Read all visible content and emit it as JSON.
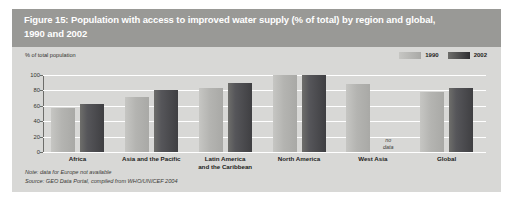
{
  "figure": {
    "title": "Figure 15: Population with access to improved water supply (% of total) by region and global,\n1990 and 2002",
    "note": "Note: data for Europe not available",
    "source": "Source:  GEO Data Portal, compiled from WHO/UNICEF 2004"
  },
  "legend": {
    "entries": [
      {
        "label": "1990",
        "color": "#b4b4b1"
      },
      {
        "label": "2002",
        "color": "#3f3f42"
      }
    ]
  },
  "axis": {
    "y_title": "% of total population",
    "ticks": [
      "100",
      "80",
      "60",
      "40",
      "20",
      "0"
    ]
  },
  "annotations": {
    "no_data": "no\ndata"
  },
  "chart_data": {
    "type": "bar",
    "title": "Figure 15: Population with access to improved water supply (% of total) by region and global, 1990 and 2002",
    "xlabel": "",
    "ylabel": "% of total population",
    "ylim": [
      0,
      100
    ],
    "yticks": [
      0,
      20,
      40,
      60,
      80,
      100
    ],
    "grid": true,
    "legend_position": "top-right",
    "categories": [
      "Africa",
      "Asia and the Pacific",
      "Latin America\nand the Caribbean",
      "North America",
      "West Asia",
      "Global"
    ],
    "series": [
      {
        "name": "1990",
        "color": "#b4b4b1",
        "values": [
          57,
          72,
          83,
          100,
          88,
          78
        ]
      },
      {
        "name": "2002",
        "color": "#3f3f42",
        "values": [
          62,
          80,
          89,
          100,
          null,
          83
        ]
      }
    ],
    "annotations": [
      {
        "category": "West Asia",
        "series": "2002",
        "text": "no data"
      }
    ],
    "note": "Note: data for Europe not available",
    "source": "Source:  GEO Data Portal, compiled from WHO/UNICEF 2004"
  }
}
